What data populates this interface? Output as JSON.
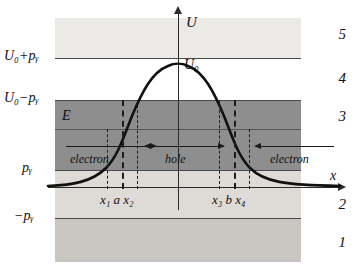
{
  "figure": {
    "type": "potential-barrier-diagram",
    "axes": {
      "y_label": "U",
      "x_label": "x"
    },
    "levels": [
      {
        "id": "u0py",
        "label": "U₀+pᵧ",
        "y_px": 58
      },
      {
        "id": "u0my",
        "label": "U₀−pᵧ",
        "y_px": 100
      },
      {
        "id": "E",
        "label": "E",
        "y_px": 129
      },
      {
        "id": "py",
        "label": "pᵧ",
        "y_px": 170
      },
      {
        "id": "mpy",
        "label": "−pᵧ",
        "y_px": 218
      }
    ],
    "peak_label": "U₀",
    "regions": [
      {
        "number": "5",
        "fill": "#eceae7"
      },
      {
        "number": "4",
        "fill": "#ffffff"
      },
      {
        "number": "3",
        "fill": "#8e8e8e"
      },
      {
        "number": "2",
        "fill": "#dedbd6"
      },
      {
        "number": "1",
        "fill": "#c9c6c1"
      }
    ],
    "turning_points": [
      {
        "label": "x₁",
        "x_px": 107,
        "weight": "thin"
      },
      {
        "label": "a",
        "x_px": 122,
        "weight": "thick"
      },
      {
        "label": "x₂",
        "x_px": 137,
        "weight": "thin"
      },
      {
        "label": "x₃",
        "x_px": 219,
        "weight": "thin"
      },
      {
        "label": "b",
        "x_px": 234,
        "weight": "thick"
      },
      {
        "label": "x₄",
        "x_px": 249,
        "weight": "thin"
      }
    ],
    "tick_groups": {
      "left": "x₁  a  x₂",
      "right": "x₃ b x₄"
    },
    "carriers": [
      {
        "label": "electron",
        "direction": "right"
      },
      {
        "label": "hole",
        "direction": "both"
      },
      {
        "label": "electron",
        "direction": "left"
      }
    ],
    "curve": {
      "description": "smooth symmetric potential barrier U(x) peaking at U₀",
      "color": "#111111",
      "path": "M 48 186 C 72 185, 92 182, 106 168 C 118 156, 124 136, 132 116 C 142 92, 152 72, 168 66 C 174 63, 182 63, 188 66 C 204 72, 214 92, 224 116 C 232 136, 238 156, 250 168 C 264 182, 284 185, 340 186"
    }
  }
}
